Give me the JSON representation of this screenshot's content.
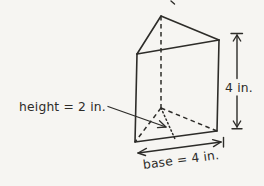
{
  "figure": {
    "type": "triangular-prism-diagram",
    "labels": {
      "triangle_height": "height = 2 in.",
      "prism_height": "4 in.",
      "base": "base = 4 in."
    },
    "colors": {
      "background": "#f6f5f2",
      "ink": "#2d2c29"
    }
  }
}
